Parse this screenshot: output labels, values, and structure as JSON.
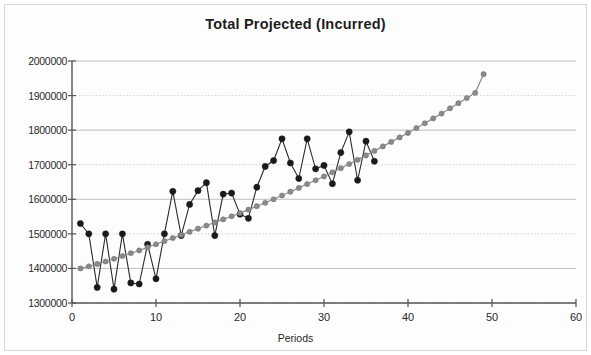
{
  "chart_data": {
    "type": "line",
    "title": "Total Projected (Incurred)",
    "xlabel": "Periods",
    "ylabel": "",
    "xlim": [
      0,
      60
    ],
    "ylim": [
      1300000,
      2000000
    ],
    "xticks": [
      0,
      10,
      20,
      30,
      40,
      50,
      60
    ],
    "yticks": [
      1300000,
      1400000,
      1500000,
      1600000,
      1700000,
      1800000,
      1900000,
      2000000
    ],
    "ytick_labels": [
      "1300000",
      "1400000",
      "1500000",
      "1600000",
      "1700000",
      "1800000",
      "1900000",
      "2000000"
    ],
    "xtick_labels": [
      "0",
      "10",
      "20",
      "30",
      "40",
      "50",
      "60"
    ],
    "grid": true,
    "legend": "none",
    "series": [
      {
        "name": "Total Projected (Incurred)",
        "style": "jagged-markers",
        "color": "#1a1a1a",
        "x": [
          1,
          2,
          3,
          4,
          5,
          6,
          7,
          8,
          9,
          10,
          11,
          12,
          13,
          14,
          15,
          16,
          17,
          18,
          19,
          20,
          21,
          22,
          23,
          24,
          25,
          26,
          27,
          28,
          29,
          30,
          31,
          32,
          33,
          34,
          35,
          36
        ],
        "values": [
          1530000,
          1500000,
          1345000,
          1500000,
          1340000,
          1500000,
          1358000,
          1355000,
          1470000,
          1370000,
          1500000,
          1623000,
          1495000,
          1585000,
          1625000,
          1648000,
          1495000,
          1615000,
          1618000,
          1557000,
          1545000,
          1635000,
          1695000,
          1712000,
          1775000,
          1705000,
          1660000,
          1775000,
          1688000,
          1698000,
          1645000,
          1735000,
          1795000,
          1655000,
          1768000,
          1710000
        ]
      },
      {
        "name": "Trend",
        "style": "smooth-markers",
        "color": "#8a8a8a",
        "x": [
          1,
          2,
          3,
          4,
          5,
          6,
          7,
          8,
          9,
          10,
          11,
          12,
          13,
          14,
          15,
          16,
          17,
          18,
          19,
          20,
          21,
          22,
          23,
          24,
          25,
          26,
          27,
          28,
          29,
          30,
          31,
          32,
          33,
          34,
          35,
          36,
          37,
          38,
          39,
          40,
          41,
          42,
          43,
          44,
          45,
          46,
          47,
          48,
          49
        ],
        "values": [
          1400000,
          1406000,
          1413000,
          1420000,
          1428000,
          1436000,
          1444000,
          1452000,
          1461000,
          1470000,
          1479000,
          1488000,
          1497000,
          1506000,
          1515000,
          1524000,
          1533000,
          1542000,
          1551000,
          1560000,
          1570000,
          1580000,
          1590000,
          1600000,
          1611000,
          1622000,
          1633000,
          1644000,
          1655000,
          1666000,
          1678000,
          1690000,
          1702000,
          1714000,
          1727000,
          1740000,
          1753000,
          1766000,
          1779000,
          1792000,
          1806000,
          1820000,
          1834000,
          1848000,
          1863000,
          1878000,
          1893000,
          1908000,
          1962000
        ]
      }
    ]
  },
  "chart": {
    "title": "Total Projected (Incurred)",
    "xaxis_title": "Periods"
  }
}
